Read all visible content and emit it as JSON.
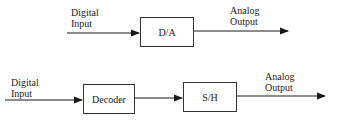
{
  "diagram": {
    "top": {
      "input_label": [
        "Digital",
        "Input"
      ],
      "block": "D/A",
      "output_label": [
        "Analog",
        "Output"
      ]
    },
    "bottom": {
      "input_label": [
        "Digital",
        "Input"
      ],
      "blocks": [
        "Decoder",
        "S/H"
      ],
      "output_label": [
        "Analog",
        "Output"
      ]
    }
  }
}
